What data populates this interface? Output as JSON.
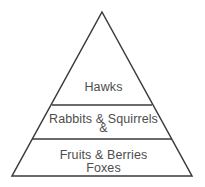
{
  "figure": {
    "type": "energy-pyramid-diagram",
    "background_color": "#ffffff",
    "stroke_color": "#3a3a3a",
    "text_color": "#4d4d4d"
  },
  "pyramid": {
    "apex": {
      "x": 102,
      "y": 12
    },
    "base_left": {
      "x": 12,
      "y": 176
    },
    "base_right": {
      "x": 192,
      "y": 176
    },
    "dividers": [
      {
        "y": 105,
        "x1": 52,
        "x2": 152
      },
      {
        "y": 139,
        "x1": 32,
        "x2": 172
      }
    ],
    "tiers": [
      {
        "id": "top",
        "label": "Hawks\n&\nFoxes",
        "lines": [
          "Hawks",
          "&",
          "Foxes"
        ]
      },
      {
        "id": "middle",
        "label": "Rabbits & Squirrels"
      },
      {
        "id": "bottom",
        "label": "Fruits & Berries"
      }
    ]
  }
}
